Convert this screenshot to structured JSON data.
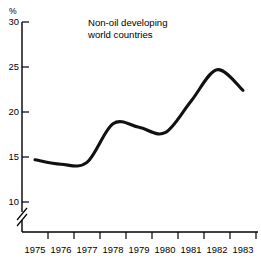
{
  "chart_data": {
    "type": "line",
    "title": "Non-oil developing world countries",
    "title_lines": [
      "Non-oil developing",
      "world countries"
    ],
    "xlabel": "",
    "ylabel": "%",
    "unit_label": "%",
    "x": [
      1975,
      1976,
      1977,
      1978,
      1979,
      1980,
      1981,
      1982,
      1983
    ],
    "categories": [
      "1975",
      "1976",
      "1977",
      "1978",
      "1979",
      "1980",
      "1981",
      "1982",
      "1983"
    ],
    "values": [
      14.7,
      14.2,
      14.4,
      18.7,
      18.3,
      17.7,
      21.2,
      24.7,
      22.4
    ],
    "series": [
      {
        "name": "Non-oil developing world countries",
        "values": [
          14.7,
          14.2,
          14.4,
          18.7,
          18.3,
          17.7,
          21.2,
          24.7,
          22.4
        ]
      }
    ],
    "ylim": [
      10,
      30
    ],
    "yticks": [
      10,
      15,
      20,
      25,
      30
    ],
    "ytick_labels": [
      "10",
      "15",
      "20",
      "25",
      "30"
    ],
    "xticks": [
      "1975",
      "1976",
      "1977",
      "1978",
      "1979",
      "1980",
      "1981",
      "1982",
      "1983"
    ],
    "grid": false,
    "legend": false,
    "legend_position": "none",
    "axis_break": true,
    "axis_break_note": "y-axis broken below 10",
    "line_color": "#111111"
  },
  "annotations": {
    "title_line_1": "Non-oil developing",
    "title_line_2": "world countries",
    "percent_symbol": "%"
  },
  "ytick_labels": {
    "t30": "30",
    "t25": "25",
    "t20": "20",
    "t15": "15",
    "t10": "10"
  },
  "xtick_labels": {
    "x1975": "1975",
    "x1976": "1976",
    "x1977": "1977",
    "x1978": "1978",
    "x1979": "1979",
    "x1980": "1980",
    "x1981": "1981",
    "x1982": "1982",
    "x1983": "1983"
  }
}
